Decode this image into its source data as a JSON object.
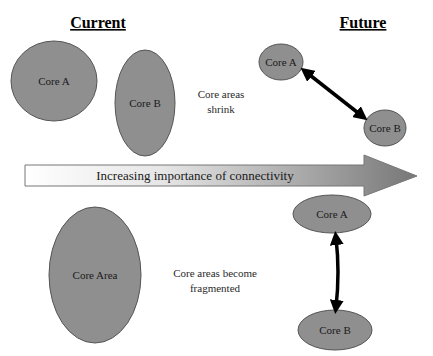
{
  "headers": {
    "current": "Current",
    "future": "Future"
  },
  "top_row": {
    "current": {
      "core_a": "Core A",
      "core_b": "Core B"
    },
    "note_line1": "Core areas",
    "note_line2": "shrink",
    "future": {
      "core_a": "Core A",
      "core_b": "Core B",
      "connector": "double-headed arrow"
    }
  },
  "main_arrow": {
    "label": "Increasing importance of connectivity",
    "gradient_start": "#ffffff",
    "gradient_end": "#7a7a7a"
  },
  "bottom_row": {
    "current": {
      "core_area": "Core Area"
    },
    "note_line1": "Core areas become",
    "note_line2": "fragmented",
    "future": {
      "core_a": "Core A",
      "core_b": "Core B",
      "connector": "double-headed arrow"
    }
  },
  "colors": {
    "core_fill": "#8f8f8f",
    "core_stroke": "#555555",
    "arrow_color": "#000000"
  }
}
